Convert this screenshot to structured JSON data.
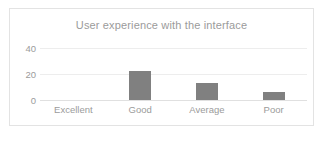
{
  "chart_data": {
    "type": "bar",
    "title": "User experience with the interface",
    "xlabel": "",
    "ylabel": "",
    "categories": [
      "Excellent",
      "Good",
      "Average",
      "Poor"
    ],
    "values": [
      0,
      22,
      13,
      6
    ],
    "yticks": [
      "0",
      "20",
      "40"
    ],
    "ylim": [
      0,
      40
    ],
    "grid": true,
    "legend": false,
    "bar_color": "#808080",
    "gridline_color": "#ededed",
    "axis_color": "#e0e0e0",
    "text_color": "#9b9b9b",
    "border_color": "#e3e3e3",
    "background": "#ffffff"
  }
}
